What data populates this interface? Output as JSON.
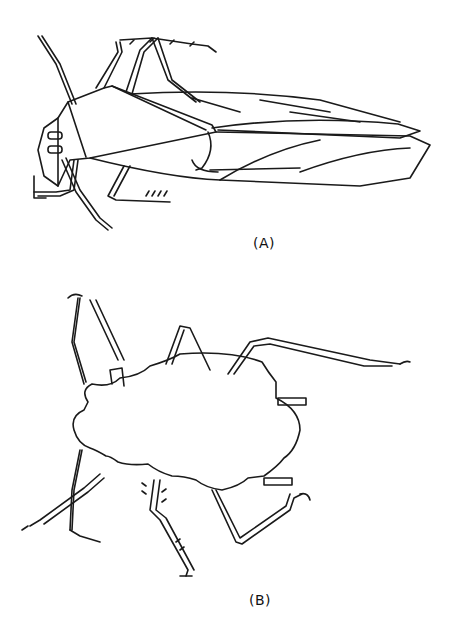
{
  "figures": [
    {
      "id": "A",
      "label": "(A)",
      "subject": "adult leafhopper, dorsal view"
    },
    {
      "id": "B",
      "label": "(B)",
      "subject": "nymph, dorsal view"
    }
  ],
  "colors": {
    "line": "#1a1a1a",
    "background": "#ffffff"
  }
}
